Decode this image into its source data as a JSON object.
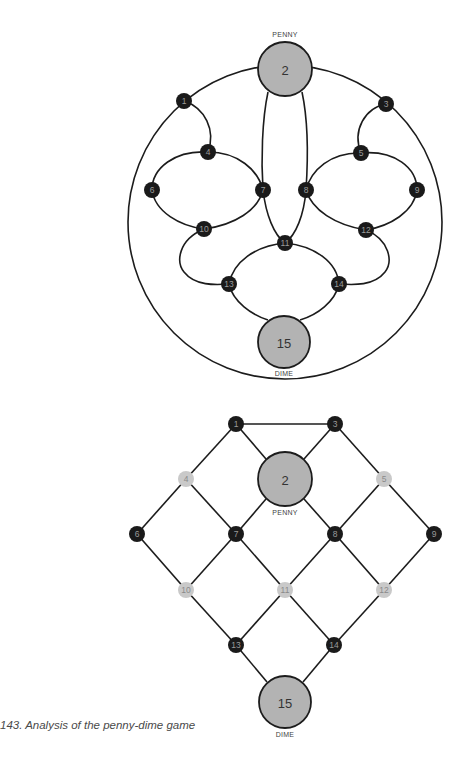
{
  "caption": "143. Analysis of the penny-dime game",
  "colors": {
    "edge": "#1c1c1c",
    "node_dark": "#1a1a1a",
    "node_light": "#c9c9c9",
    "coin_fill": "#b3b3b3"
  },
  "top_diagram": {
    "title": "Circular board",
    "outer_circle": {
      "cx": 285,
      "cy": 222,
      "r": 157
    },
    "penny": {
      "label": "PENNY",
      "number": "2",
      "cx": 285,
      "cy": 69,
      "r": 27
    },
    "dime": {
      "label": "DIME",
      "number": "15",
      "cx": 284,
      "cy": 342,
      "r": 26
    },
    "nodes": [
      {
        "id": "1",
        "cx": 184,
        "cy": 101
      },
      {
        "id": "3",
        "cx": 386,
        "cy": 104
      },
      {
        "id": "4",
        "cx": 208,
        "cy": 152
      },
      {
        "id": "5",
        "cx": 361,
        "cy": 153
      },
      {
        "id": "6",
        "cx": 152,
        "cy": 190
      },
      {
        "id": "7",
        "cx": 263,
        "cy": 190
      },
      {
        "id": "8",
        "cx": 306,
        "cy": 190
      },
      {
        "id": "9",
        "cx": 417,
        "cy": 190
      },
      {
        "id": "10",
        "cx": 204,
        "cy": 229
      },
      {
        "id": "11",
        "cx": 285,
        "cy": 243
      },
      {
        "id": "12",
        "cx": 366,
        "cy": 230
      },
      {
        "id": "13",
        "cx": 229,
        "cy": 284
      },
      {
        "id": "14",
        "cx": 339,
        "cy": 284
      }
    ]
  },
  "bottom_diagram": {
    "title": "Lattice analysis",
    "penny": {
      "label": "PENNY",
      "number": "2",
      "cx": 285,
      "cy": 479,
      "r": 27
    },
    "dime": {
      "label": "DIME",
      "number": "15",
      "cx": 285,
      "cy": 702,
      "r": 26
    },
    "nodes": [
      {
        "id": "1",
        "cx": 236,
        "cy": 424,
        "shade": "dark"
      },
      {
        "id": "3",
        "cx": 335,
        "cy": 424,
        "shade": "dark"
      },
      {
        "id": "4",
        "cx": 186,
        "cy": 479,
        "shade": "light"
      },
      {
        "id": "5",
        "cx": 384,
        "cy": 479,
        "shade": "light"
      },
      {
        "id": "6",
        "cx": 137,
        "cy": 534,
        "shade": "dark"
      },
      {
        "id": "7",
        "cx": 236,
        "cy": 534,
        "shade": "dark"
      },
      {
        "id": "8",
        "cx": 335,
        "cy": 534,
        "shade": "dark"
      },
      {
        "id": "9",
        "cx": 434,
        "cy": 534,
        "shade": "dark"
      },
      {
        "id": "10",
        "cx": 186,
        "cy": 590,
        "shade": "light"
      },
      {
        "id": "11",
        "cx": 285,
        "cy": 590,
        "shade": "light"
      },
      {
        "id": "12",
        "cx": 384,
        "cy": 590,
        "shade": "light"
      },
      {
        "id": "13",
        "cx": 236,
        "cy": 645,
        "shade": "dark"
      },
      {
        "id": "14",
        "cx": 334,
        "cy": 645,
        "shade": "dark"
      }
    ],
    "edges": [
      [
        "1",
        "3"
      ],
      [
        "1",
        "2"
      ],
      [
        "3",
        "2"
      ],
      [
        "1",
        "4"
      ],
      [
        "3",
        "5"
      ],
      [
        "4",
        "6"
      ],
      [
        "4",
        "7"
      ],
      [
        "2",
        "7"
      ],
      [
        "2",
        "8"
      ],
      [
        "5",
        "8"
      ],
      [
        "5",
        "9"
      ],
      [
        "6",
        "10"
      ],
      [
        "7",
        "10"
      ],
      [
        "7",
        "11"
      ],
      [
        "8",
        "11"
      ],
      [
        "8",
        "12"
      ],
      [
        "9",
        "12"
      ],
      [
        "10",
        "13"
      ],
      [
        "11",
        "13"
      ],
      [
        "11",
        "14"
      ],
      [
        "12",
        "14"
      ],
      [
        "13",
        "15"
      ],
      [
        "14",
        "15"
      ]
    ]
  }
}
